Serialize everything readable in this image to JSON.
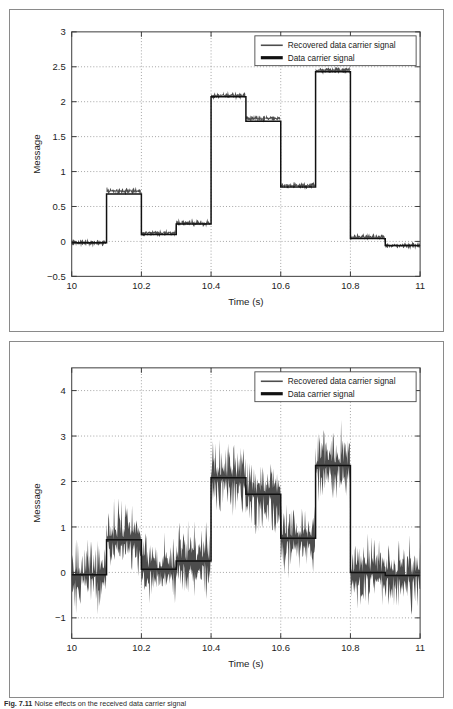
{
  "figure": {
    "caption_prefix": "Fig. 7.11",
    "caption_text": "Noise effects on the received data carrier signal",
    "panel_count": 2
  },
  "legend": {
    "series": [
      {
        "key": "recovered",
        "label": "Recovered data carrier signal",
        "color": "#4d4d4d",
        "style": "thin"
      },
      {
        "key": "clean",
        "label": "Data carrier signal",
        "color": "#111111",
        "style": "thick"
      }
    ]
  },
  "chart_data": [
    {
      "id": "top-chart",
      "type": "line",
      "title": "",
      "xlabel": "Time (s)",
      "ylabel": "Message",
      "xlim": [
        10,
        11
      ],
      "ylim": [
        -0.5,
        3
      ],
      "xticks": [
        10,
        10.2,
        10.4,
        10.6,
        10.8,
        11
      ],
      "xtick_labels": [
        "10",
        "10.2",
        "10.4",
        "10.6",
        "10.8",
        "11"
      ],
      "yticks": [
        -0.5,
        0,
        0.5,
        1,
        1.5,
        2,
        2.5,
        3
      ],
      "ytick_labels": [
        "-0.5",
        "0",
        "0.5",
        "1",
        "1.5",
        "2",
        "2.5",
        "3"
      ],
      "grid": true,
      "legend_position": "upper right",
      "noise_amplitude": 0.07,
      "step_edges": [
        10.0,
        10.1,
        10.2,
        10.3,
        10.4,
        10.5,
        10.6,
        10.7,
        10.8,
        10.9,
        11.0
      ],
      "series": [
        {
          "name": "Data carrier signal",
          "key": "clean",
          "values": [
            -0.02,
            0.68,
            0.1,
            0.25,
            2.07,
            1.72,
            0.78,
            2.43,
            0.04,
            -0.06
          ]
        },
        {
          "name": "Recovered data carrier signal",
          "key": "recovered",
          "values": [
            -0.02,
            0.72,
            0.12,
            0.26,
            2.09,
            1.76,
            0.8,
            2.45,
            0.06,
            -0.06
          ]
        }
      ]
    },
    {
      "id": "bottom-chart",
      "type": "line",
      "title": "",
      "xlabel": "Time (s)",
      "ylabel": "Message",
      "xlim": [
        10,
        11
      ],
      "ylim": [
        -1.45,
        4.5
      ],
      "xticks": [
        10,
        10.2,
        10.4,
        10.6,
        10.8,
        11
      ],
      "xtick_labels": [
        "10",
        "10.2",
        "10.4",
        "10.6",
        "10.8",
        "11"
      ],
      "yticks": [
        -1,
        0,
        1,
        2,
        3,
        4
      ],
      "ytick_labels": [
        "-1",
        "0",
        "1",
        "2",
        "3",
        "4"
      ],
      "grid": true,
      "legend_position": "upper right",
      "noise_amplitude": 0.95,
      "step_edges": [
        10.0,
        10.1,
        10.2,
        10.3,
        10.4,
        10.5,
        10.6,
        10.7,
        10.8,
        10.9,
        11.0
      ],
      "series": [
        {
          "name": "Data carrier signal",
          "key": "clean",
          "values": [
            -0.05,
            0.72,
            0.07,
            0.25,
            2.08,
            1.72,
            0.75,
            2.35,
            0.0,
            -0.07
          ]
        },
        {
          "name": "Recovered data carrier signal",
          "key": "recovered",
          "values": [
            -0.05,
            0.72,
            0.07,
            0.25,
            2.08,
            1.72,
            0.75,
            2.35,
            0.0,
            -0.07
          ]
        }
      ]
    }
  ]
}
